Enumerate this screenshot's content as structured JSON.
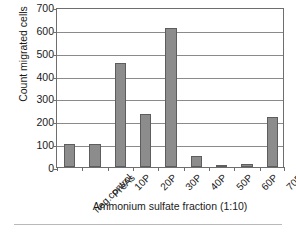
{
  "chart_data": {
    "type": "bar",
    "title": "",
    "xlabel": "Ammonium sulfate fraction (1:10)",
    "ylabel": "Count migrated cells",
    "categories": [
      "neg.control",
      "PreAs",
      "10P",
      "20P",
      "30P",
      "40P",
      "50P",
      "60P",
      "70P"
    ],
    "values": [
      100,
      100,
      455,
      230,
      610,
      50,
      5,
      15,
      220
    ],
    "ylim": [
      0,
      700
    ],
    "ytick_labels": [
      "0",
      "100",
      "200",
      "300",
      "400",
      "500",
      "600",
      "700"
    ],
    "ytick_values": [
      0,
      100,
      200,
      300,
      400,
      500,
      600,
      700
    ],
    "grid": true,
    "legend": false,
    "bar_color": "#8c8c8c",
    "bar_edge_color": "#5d5d5d",
    "grid_color": "#8a8a8a",
    "axis_color": "#6e6e6e",
    "text_color": "#1a1a1a",
    "background_color": "#ffffff"
  }
}
